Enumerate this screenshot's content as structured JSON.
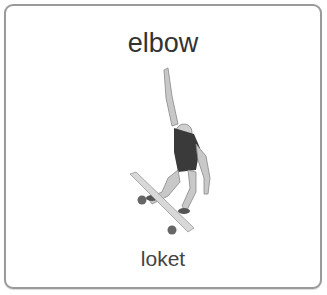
{
  "card": {
    "word": "elbow",
    "translation": "loket",
    "illustration": "skateboarder-jumping-icon"
  },
  "colors": {
    "border": "#9a9a9a",
    "text": "#333333",
    "shirt": "#3a3a3a",
    "skin": "#c8c8c8",
    "wheel": "#666666"
  }
}
